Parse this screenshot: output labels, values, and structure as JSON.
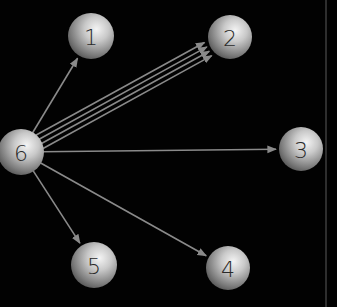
{
  "diagram": {
    "type": "directed-graph",
    "background": "#020202",
    "edge_color": "#8a8a8a",
    "border_line": {
      "x": 326,
      "color": "#6a6a6a"
    },
    "nodes": [
      {
        "id": "1",
        "label": "1",
        "x": 91,
        "y": 36,
        "r": 23
      },
      {
        "id": "2",
        "label": "2",
        "x": 230,
        "y": 37,
        "r": 22
      },
      {
        "id": "3",
        "label": "3",
        "x": 301,
        "y": 149,
        "r": 22
      },
      {
        "id": "4",
        "label": "4",
        "x": 228,
        "y": 268,
        "r": 22
      },
      {
        "id": "5",
        "label": "5",
        "x": 94,
        "y": 265,
        "r": 23
      },
      {
        "id": "6",
        "label": "6",
        "x": 21,
        "y": 152,
        "r": 23
      }
    ],
    "edges": [
      {
        "from": "6",
        "to": "1",
        "count": 1
      },
      {
        "from": "6",
        "to": "2",
        "count": 4
      },
      {
        "from": "6",
        "to": "3",
        "count": 1
      },
      {
        "from": "6",
        "to": "4",
        "count": 1
      },
      {
        "from": "6",
        "to": "5",
        "count": 1
      }
    ]
  }
}
